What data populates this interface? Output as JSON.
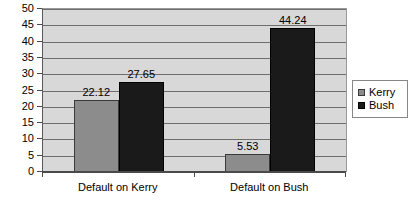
{
  "chart_data": {
    "type": "bar",
    "title": "",
    "subtitle": "",
    "xlabel": "",
    "ylabel": "",
    "categories": [
      "Default on Kerry",
      "Default on Bush"
    ],
    "series": [
      {
        "name": "Kerry",
        "color": "#8c8c8c",
        "values": [
          22.12,
          5.53
        ]
      },
      {
        "name": "Bush",
        "color": "#1a1a1a",
        "values": [
          27.65,
          44.24
        ]
      }
    ],
    "data_labels": [
      "22.12",
      "27.65",
      "5.53",
      "44.24"
    ],
    "ylim": [
      0,
      50
    ],
    "y_ticks": [
      0,
      5,
      10,
      15,
      20,
      25,
      30,
      35,
      40,
      45,
      50
    ],
    "y_tick_labels": [
      "0",
      "5",
      "10",
      "15",
      "20",
      "25",
      "30",
      "35",
      "40",
      "45",
      "50"
    ],
    "grid": true,
    "grid_axis": "y",
    "legend_position": "right",
    "legend_entries": [
      "Kerry",
      "Bush"
    ],
    "plot_background": "#d8d8d8",
    "page_background": "#ffffff"
  }
}
